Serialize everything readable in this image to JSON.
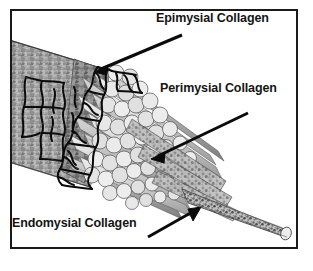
{
  "figure": {
    "frame_color": "#1a1a1a",
    "background_color": "#ffffff",
    "annotations": [
      {
        "id": "epimysial",
        "label": "Epimysial Collagen",
        "arrow_from": [
          180,
          33
        ],
        "arrow_to": [
          92,
          69
        ]
      },
      {
        "id": "perimysial",
        "label": "Perimysial Collagen",
        "arrow_from": [
          246,
          111
        ],
        "arrow_to": [
          149,
          156
        ]
      },
      {
        "id": "endomysial",
        "label": "Endomysial Collagen",
        "arrow_from": [
          148,
          235
        ],
        "arrow_to": [
          197,
          207
        ]
      }
    ],
    "structures": {
      "epimysium": "mottled-gray-sheath",
      "epimysial_network": "black-collagen-mesh",
      "fascicles": "cylindrical-fiber-bundles",
      "single_fiber": "tapered-endomysium-tail"
    },
    "colors": {
      "ink": "#141414",
      "sheath_fill": "#b9b9b9",
      "fiber_fill": "#d9d9d9",
      "fiber_cap": "#ececec",
      "shadow": "#8a8a8a"
    }
  }
}
